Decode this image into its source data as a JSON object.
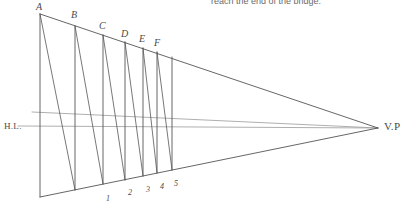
{
  "page": {
    "background_color": "#ffffff",
    "width": 406,
    "height": 213
  },
  "caption": {
    "text": "reach the end of the bridge."
  },
  "diagram": {
    "line_color": "#555555",
    "guide_color": "#9a9a9a",
    "vanishing_point": {
      "x": 378,
      "y": 128,
      "label": "V.P"
    },
    "horizon": {
      "label": "H.L.",
      "y": 126,
      "label_x": 4,
      "label_y": 121
    },
    "upper_guide": {
      "left_x": 32,
      "left_y": 112,
      "right_x": 378,
      "right_y": 128
    },
    "top_edge": {
      "start_x": 40,
      "start_y": 14,
      "end_x": 378,
      "end_y": 128
    },
    "bottom_edge": {
      "start_x": 40,
      "start_y": 197,
      "end_x": 378,
      "end_y": 128
    },
    "posts": [
      {
        "id": "A",
        "label": "A",
        "x": 40,
        "top_y": 14,
        "bottom_y": 197,
        "label_x": 36,
        "label_y": 1,
        "base_label": ""
      },
      {
        "id": "B",
        "label": "B",
        "x": 75,
        "top_y": 26,
        "bottom_y": 190,
        "label_x": 71,
        "label_y": 9,
        "base_label": ""
      },
      {
        "id": "C",
        "label": "C",
        "x": 103,
        "top_y": 35,
        "bottom_y": 184,
        "label_x": 99,
        "label_y": 20,
        "base_label": "1"
      },
      {
        "id": "D",
        "label": "D",
        "x": 125,
        "top_y": 42,
        "bottom_y": 180,
        "label_x": 121,
        "label_y": 28,
        "base_label": "2"
      },
      {
        "id": "E",
        "label": "E",
        "x": 143,
        "top_y": 48,
        "bottom_y": 176,
        "label_x": 139,
        "label_y": 33,
        "base_label": "3"
      },
      {
        "id": "F",
        "label": "F",
        "x": 157,
        "top_y": 52,
        "bottom_y": 173,
        "label_x": 154,
        "label_y": 37,
        "base_label": "4"
      },
      {
        "id": "G",
        "label": "",
        "x": 172,
        "top_y": 57,
        "bottom_y": 170,
        "label_x": 0,
        "label_y": 0,
        "base_label": "5"
      }
    ],
    "base_marks": [
      {
        "label": "1",
        "x": 106,
        "y": 194
      },
      {
        "label": "2",
        "x": 128,
        "y": 188
      },
      {
        "label": "3",
        "x": 146,
        "y": 185
      },
      {
        "label": "4",
        "x": 160,
        "y": 182
      },
      {
        "label": "5",
        "x": 174,
        "y": 179
      }
    ],
    "braces": [
      {
        "from": "A",
        "to": "B",
        "x1": 40,
        "y1": 14,
        "x2": 75,
        "y2": 190
      },
      {
        "from": "B",
        "to": "C",
        "x1": 75,
        "y1": 26,
        "x2": 103,
        "y2": 184
      },
      {
        "from": "C",
        "to": "D",
        "x1": 103,
        "y1": 35,
        "x2": 125,
        "y2": 180
      },
      {
        "from": "D",
        "to": "E",
        "x1": 125,
        "y1": 42,
        "x2": 143,
        "y2": 176
      },
      {
        "from": "E",
        "to": "F",
        "x1": 143,
        "y1": 48,
        "x2": 157,
        "y2": 173
      },
      {
        "from": "F",
        "to": "G",
        "x1": 157,
        "y1": 52,
        "x2": 172,
        "y2": 170
      }
    ]
  }
}
